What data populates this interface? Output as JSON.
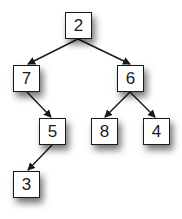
{
  "diagram": {
    "type": "binary-tree",
    "colors": {
      "node_border": "#1a1a1a",
      "node_fill": "#ffffff",
      "edge": "#1a1a1a",
      "background": "#ffffff"
    },
    "nodes": [
      {
        "id": "n2",
        "label": "2",
        "x": 65,
        "y": 12
      },
      {
        "id": "n7",
        "label": "7",
        "x": 13,
        "y": 65
      },
      {
        "id": "n6",
        "label": "6",
        "x": 117,
        "y": 65
      },
      {
        "id": "n5",
        "label": "5",
        "x": 39,
        "y": 118
      },
      {
        "id": "n8",
        "label": "8",
        "x": 91,
        "y": 118
      },
      {
        "id": "n4",
        "label": "4",
        "x": 143,
        "y": 118
      },
      {
        "id": "n3",
        "label": "3",
        "x": 13,
        "y": 171
      }
    ],
    "edges": [
      {
        "from": "n2",
        "to": "n7"
      },
      {
        "from": "n2",
        "to": "n6"
      },
      {
        "from": "n7",
        "to": "n5"
      },
      {
        "from": "n6",
        "to": "n8"
      },
      {
        "from": "n6",
        "to": "n4"
      },
      {
        "from": "n5",
        "to": "n3"
      }
    ]
  }
}
